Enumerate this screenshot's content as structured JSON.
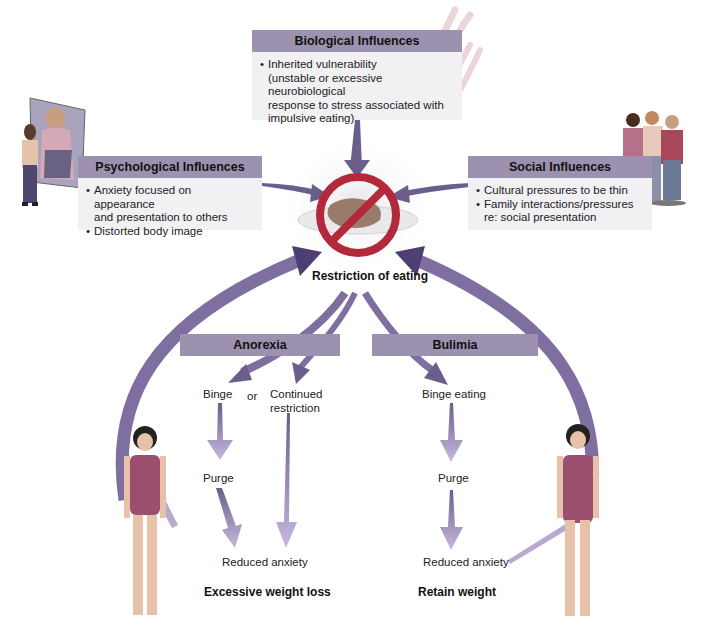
{
  "biological": {
    "title": "Biological Influences",
    "items": [
      "Inherited vulnerability (unstable or excessive neurobiological response to stress associated with impulsive eating)"
    ],
    "line1": "Inherited vulnerability",
    "line2": "(unstable or excessive neurobiological",
    "line3": "response to stress associated with",
    "line4": "impulsive eating)"
  },
  "psychological": {
    "title": "Psychological Influences",
    "item1_line1": "Anxiety focused on appearance",
    "item1_line2": "and presentation to others",
    "item2": "Distorted body image"
  },
  "social": {
    "title": "Social Influences",
    "item1": "Cultural pressures to be thin",
    "item2_line1": "Family interactions/pressures",
    "item2_line2": "re: social presentation"
  },
  "center": {
    "label": "Restriction of eating",
    "icon": "no-food-prohibition-icon"
  },
  "anorexia": {
    "title": "Anorexia",
    "binge": "Binge",
    "or": "or",
    "continued_line1": "Continued",
    "continued_line2": "restriction",
    "purge": "Purge",
    "reduced": "Reduced anxiety",
    "outcome": "Excessive weight loss"
  },
  "bulimia": {
    "title": "Bulimia",
    "binge": "Binge eating",
    "purge": "Purge",
    "reduced": "Reduced anxiety",
    "outcome": "Retain weight"
  },
  "colors": {
    "header_bar": "#9c92b0",
    "box_fill": "#f1f1f3",
    "arrow_dark": "#6b5e8c",
    "arrow_light": "#b9a9cf",
    "prohibition_red": "#b3283a",
    "feedback_arrow": "#8a7aa8"
  },
  "illustrations": {
    "top": "chromosome-icon",
    "left": "woman-mirror-illustration",
    "right": "family-group-illustration",
    "bottom_left": "woman-swimsuit-illustration",
    "bottom_right": "woman-swimsuit-illustration"
  }
}
